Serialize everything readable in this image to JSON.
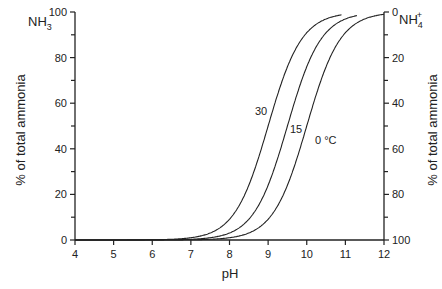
{
  "chart_data": {
    "type": "line",
    "title": "",
    "xlabel": "pH",
    "ylabel_left": "% of total ammonia",
    "ylabel_right": "% of total ammonia",
    "left_species": "NH3",
    "right_species": "NH4+",
    "xlim": [
      4,
      12
    ],
    "ylim": [
      0,
      100
    ],
    "x_ticks": [
      4,
      5,
      6,
      7,
      8,
      9,
      10,
      11,
      12
    ],
    "y_ticks_left": [
      0,
      20,
      40,
      60,
      80,
      100
    ],
    "y_ticks_right": [
      100,
      80,
      60,
      40,
      20,
      0
    ],
    "grid": false,
    "series": [
      {
        "name": "30",
        "pKa": 9.0,
        "x": [
          7.0,
          7.5,
          8.0,
          8.5,
          9.0,
          9.5,
          10.0,
          10.5,
          10.9
        ],
        "values": [
          0.1,
          0.3,
          1.0,
          2.6,
          50,
          76,
          91,
          97,
          98.7
        ]
      },
      {
        "name": "15",
        "pKa": 9.5,
        "x": [
          7.5,
          8.0,
          8.5,
          9.0,
          9.5,
          10.0,
          10.5,
          11.0,
          11.3
        ],
        "values": [
          1.0,
          3.1,
          9.1,
          24,
          50,
          76,
          91,
          97,
          98.5
        ]
      },
      {
        "name": "0 °C",
        "pKa": 10.0,
        "x": [
          8.0,
          8.5,
          9.0,
          9.5,
          10.0,
          10.5,
          11.0,
          11.5,
          12.0
        ],
        "values": [
          1.0,
          3.1,
          9.1,
          24,
          50,
          76,
          91,
          97,
          99
        ]
      }
    ],
    "annotations": [
      "30",
      "15",
      "0 °C"
    ]
  }
}
